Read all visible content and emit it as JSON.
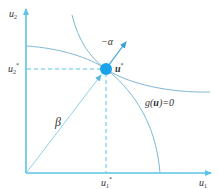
{
  "diagram": {
    "type": "optimization-geometry",
    "colors": {
      "axis": "#5bc4e8",
      "curve": "#7fb8d6",
      "point": "#1aa3e8",
      "dashed": "#5bc4e8",
      "beta_line": "#8fd0ea",
      "alpha_arrow": "#3a9fd8",
      "label": "#333333"
    },
    "axes": {
      "x_label": "u",
      "x_sub": "1",
      "y_label": "u",
      "y_sub": "2"
    },
    "point": {
      "label": "u",
      "sup": "*",
      "x_tick_label": "u",
      "x_tick_sub": "1",
      "x_tick_sup": "*",
      "y_tick_label": "u",
      "y_tick_sub": "2",
      "y_tick_sup": "*"
    },
    "labels": {
      "alpha": "−α",
      "beta": "β",
      "constraint": "g(u)=0",
      "constraint_prefix": "g(",
      "constraint_var": "u",
      "constraint_suffix": ")=0"
    }
  }
}
